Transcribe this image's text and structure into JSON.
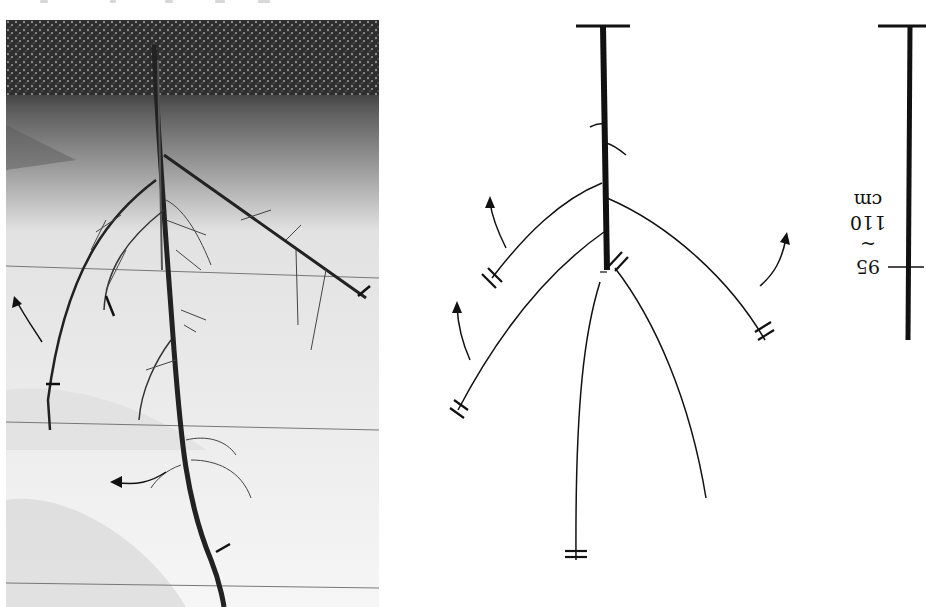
{
  "figure": {
    "orientation": "rotated 180 degrees",
    "photo": {
      "subject": "pruned plant branch / root structure photographed against white sheet",
      "background_colors": {
        "foliage": "#3a3a3a",
        "sheet_dark": "#9a9a9a",
        "sheet_light": "#f4f4f4"
      },
      "annotations": {
        "cut_marks": 5,
        "arrows": 3
      }
    },
    "diagram": {
      "line_color": "#111111",
      "main_stem": "thick vertical line with crossbar at end",
      "branches": 6,
      "double_cut_marks": 5,
      "arrows": 3
    },
    "scale_bar": {
      "value_low": "95",
      "separator": "~",
      "value_high": "110",
      "unit": "cm"
    }
  }
}
